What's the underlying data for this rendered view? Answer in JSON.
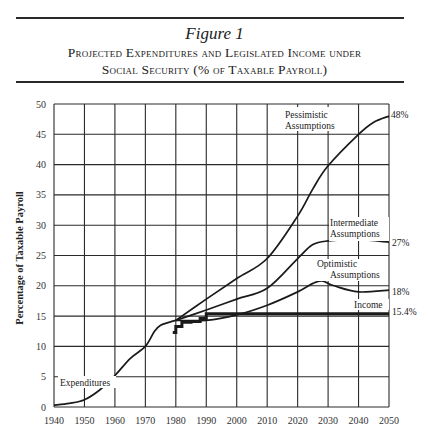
{
  "figure": {
    "label": "Figure 1",
    "title_line1": "Projected Expenditures and Legislated Income under",
    "title_line2": "Social Security (% of Taxable Payroll)"
  },
  "chart_data": {
    "type": "line",
    "xlabel": "",
    "ylabel": "Percentage of Taxable Payroll",
    "xlim": [
      1940,
      2050
    ],
    "ylim": [
      0,
      50
    ],
    "x_ticks": [
      1940,
      1950,
      1960,
      1970,
      1980,
      1990,
      2000,
      2010,
      2020,
      2030,
      2040,
      2050
    ],
    "y_ticks": [
      0,
      5,
      10,
      15,
      20,
      25,
      30,
      35,
      40,
      45,
      50
    ],
    "grid": true,
    "legend": "inline annotations",
    "series": [
      {
        "name": "Expenditures",
        "x": [
          1940,
          1945,
          1950,
          1955,
          1960,
          1965,
          1970,
          1973,
          1975,
          1978,
          1980
        ],
        "values": [
          0.3,
          0.6,
          1.2,
          2.8,
          5.2,
          8.0,
          10.0,
          12.5,
          13.5,
          14.0,
          14.3
        ]
      },
      {
        "name": "Pessimistic Assumptions",
        "end_label": "48%",
        "x": [
          1980,
          1990,
          2000,
          2010,
          2020,
          2025,
          2030,
          2040,
          2045,
          2050
        ],
        "values": [
          14.3,
          17.8,
          21.2,
          24.5,
          31.5,
          36.0,
          39.8,
          45.0,
          47.0,
          48.0
        ]
      },
      {
        "name": "Intermediate Assumptions",
        "end_label": "27%",
        "x": [
          1980,
          1990,
          2000,
          2010,
          2020,
          2025,
          2030,
          2040,
          2050
        ],
        "values": [
          14.3,
          16.0,
          17.8,
          19.6,
          24.5,
          26.8,
          27.4,
          27.6,
          27.2
        ]
      },
      {
        "name": "Optimistic Assumptions",
        "end_label": "18%",
        "x": [
          1980,
          1990,
          2000,
          2010,
          2020,
          2025,
          2028,
          2032,
          2040,
          2050
        ],
        "values": [
          14.3,
          14.3,
          15.2,
          16.8,
          19.0,
          20.4,
          20.8,
          20.0,
          19.0,
          19.3
        ]
      },
      {
        "name": "Income",
        "end_label": "15.4%",
        "step": true,
        "x": [
          1979,
          1980,
          1982,
          1985,
          1988,
          1990,
          2050
        ],
        "values": [
          12.3,
          13.3,
          14.0,
          14.1,
          14.6,
          15.4,
          15.4
        ]
      }
    ]
  },
  "annotations": {
    "expenditures": "Expenditures",
    "pessimistic_1": "Pessimistic",
    "pessimistic_2": "Assumptions",
    "intermediate_1": "Intermediate",
    "intermediate_2": "Assumptions",
    "optimistic_1": "Optimistic",
    "optimistic_2": "Assumptions",
    "income": "Income",
    "end_48": "48%",
    "end_27": "27%",
    "end_18": "18%",
    "end_154": "15.4%"
  },
  "colors": {
    "ink": "#1a1a1a",
    "grid": "#2a2a2a",
    "background": "#ffffff"
  }
}
